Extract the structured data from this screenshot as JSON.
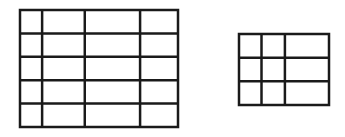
{
  "diagram": {
    "stroke_color": "#1a1a1a",
    "background_color": "#ffffff",
    "grids": [
      {
        "id": "large-grid",
        "rows": 5,
        "columns": 4,
        "column_proportions": [
          0.14,
          0.27,
          0.35,
          0.24
        ],
        "cells": [
          [
            "",
            "",
            "",
            ""
          ],
          [
            "",
            "",
            "",
            ""
          ],
          [
            "",
            "",
            "",
            ""
          ],
          [
            "",
            "",
            "",
            ""
          ],
          [
            "",
            "",
            "",
            ""
          ]
        ]
      },
      {
        "id": "small-grid",
        "rows": 3,
        "columns": 3,
        "column_proportions": [
          0.25,
          0.26,
          0.49
        ],
        "cells": [
          [
            "",
            "",
            ""
          ],
          [
            "",
            "",
            ""
          ],
          [
            "",
            "",
            ""
          ]
        ]
      }
    ]
  }
}
